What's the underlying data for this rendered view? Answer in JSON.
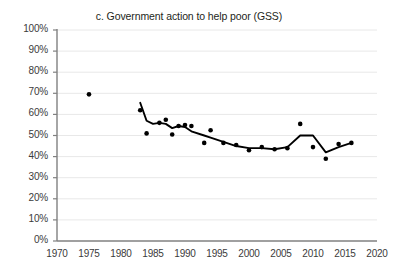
{
  "chart_data": {
    "type": "scatter",
    "title": "c. Government action to help poor (GSS)",
    "xlabel": "",
    "ylabel": "",
    "xlim": [
      1970,
      2020
    ],
    "ylim": [
      0,
      100
    ],
    "grid": true,
    "legend": "none",
    "y_tick_labels": [
      "100%",
      "90%",
      "80%",
      "70%",
      "60%",
      "50%",
      "40%",
      "30%",
      "20%",
      "10%",
      "0%"
    ],
    "y_ticks": [
      100,
      90,
      80,
      70,
      60,
      50,
      40,
      30,
      20,
      10,
      0
    ],
    "x_tick_labels": [
      "1970",
      "1975",
      "1980",
      "1985",
      "1990",
      "1995",
      "2000",
      "2005",
      "2010",
      "2015",
      "2020"
    ],
    "x_ticks": [
      1970,
      1975,
      1980,
      1985,
      1990,
      1995,
      2000,
      2005,
      2010,
      2015,
      2020
    ],
    "series": [
      {
        "name": "Survey points",
        "marker": "circle",
        "color": "#000000",
        "x": [
          1975,
          1983,
          1984,
          1986,
          1987,
          1988,
          1989,
          1990,
          1991,
          1993,
          1994,
          1996,
          1998,
          2000,
          2002,
          2004,
          2006,
          2008,
          2010,
          2012,
          2014,
          2016
        ],
        "y": [
          69.5,
          62.0,
          51.0,
          56.0,
          57.5,
          50.5,
          54.5,
          55.0,
          54.5,
          46.5,
          52.5,
          46.5,
          45.5,
          43.0,
          44.5,
          43.5,
          44.0,
          55.5,
          44.5,
          39.0,
          46.0,
          46.5
        ]
      },
      {
        "name": "Trend line",
        "marker": "none",
        "color": "#000000",
        "x": [
          1983,
          1984,
          1985,
          1986,
          1987,
          1988,
          1989,
          1990,
          1991,
          1993,
          1994,
          1996,
          1998,
          2000,
          2002,
          2004,
          2006,
          2008,
          2010,
          2012,
          2014,
          2016
        ],
        "y": [
          65.5,
          57.0,
          55.5,
          56.0,
          55.5,
          53.5,
          54.5,
          54.0,
          52.0,
          50.0,
          49.0,
          47.0,
          45.0,
          44.0,
          44.0,
          43.5,
          44.5,
          50.0,
          50.0,
          42.0,
          44.5,
          46.5
        ]
      }
    ]
  },
  "axis_colors": {
    "grid": "#e8e8e8",
    "axis": "#808080",
    "data": "#000000"
  }
}
